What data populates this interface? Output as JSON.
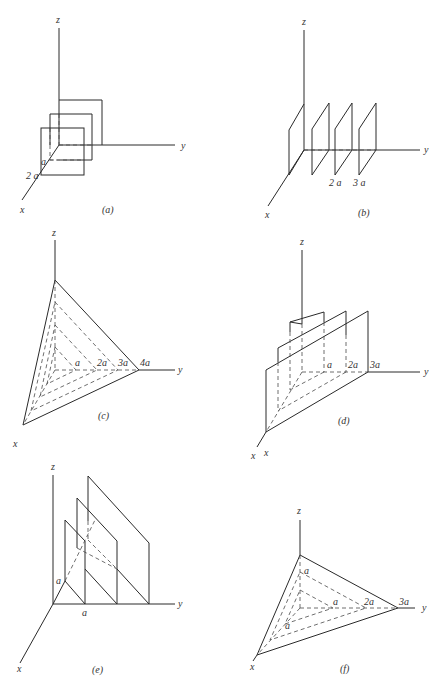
{
  "figure": {
    "panels": [
      {
        "id": "a",
        "caption": "(a)",
        "axes": {
          "x": "x",
          "y": "y",
          "z": "z"
        },
        "labels": [
          "a",
          "2 a"
        ],
        "description": "Three square planes parallel to the yz-plane, stacked along x"
      },
      {
        "id": "b",
        "caption": "(b)",
        "axes": {
          "x": "x",
          "y": "y",
          "z": "z"
        },
        "labels": [
          "2 a",
          "3 a"
        ],
        "description": "Four parallel planes perpendicular to the y-axis, spaced by a"
      },
      {
        "id": "c",
        "caption": "(c)",
        "axes": {
          "x": "x",
          "y": "y",
          "z": "z"
        },
        "labels": [
          "a",
          "2a",
          "3a",
          "4a"
        ],
        "description": "Nested triangular planes x+y+z = a, 2a, 3a, 4a"
      },
      {
        "id": "d",
        "caption": "(d)",
        "axes": {
          "x": "x",
          "y": "y",
          "z": "z"
        },
        "labels": [
          "a",
          "2a",
          "3a"
        ],
        "description": "Three stepped planes parallel to the x-axis"
      },
      {
        "id": "e",
        "caption": "(e)",
        "axes": {
          "x": "x",
          "y": "y",
          "z": "z"
        },
        "labels": [
          "a",
          "a"
        ],
        "description": "Parallel inclined planes along y-axis"
      },
      {
        "id": "f",
        "caption": "(f)",
        "axes": {
          "x": "x",
          "y": "y",
          "z": "z"
        },
        "stray_label": "x",
        "labels": [
          "a",
          "a",
          "2a",
          "3a",
          "a"
        ],
        "description": "Nested triangular planes with intercepts a, 2a, 3a"
      }
    ]
  }
}
